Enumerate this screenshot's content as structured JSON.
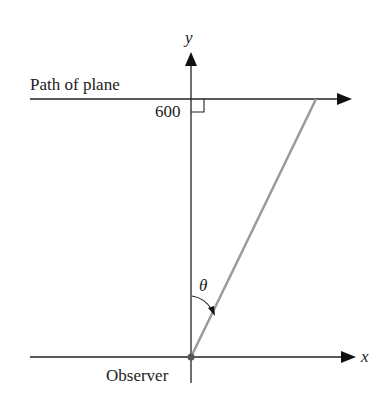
{
  "diagram": {
    "path_label": "Path of plane",
    "height_label": "600",
    "y_axis_label": "y",
    "x_axis_label": "x",
    "angle_label": "θ",
    "observer_label": "Observer",
    "colors": {
      "ink": "#222222",
      "sightline": "#9a9a9a"
    }
  }
}
